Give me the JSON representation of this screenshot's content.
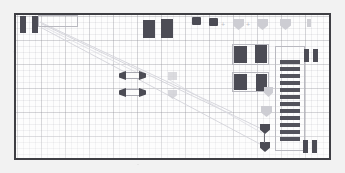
{
  "app": {
    "title": "PCB Layout Canvas",
    "view": "board-editor"
  },
  "canvas": {
    "name": "board-outline",
    "background_color": "#fdfdfd",
    "page_background_color": "#f2f2f2",
    "border_color": "#3f3f44",
    "grid": {
      "visible": true,
      "minor_pitch_px": 6,
      "major_pitch_px": 24,
      "color": "#9a9aa2"
    }
  },
  "palette": {
    "pad_dark": "#4c4c55",
    "pad_light": "#cdcdd3",
    "outline": "#b9b9c0",
    "ratline": "#cfcfd6"
  },
  "legend": {
    "pad_label": "pad",
    "shield_label": "shield-footprint",
    "ladder_label": "resistor-array",
    "ratline_label": "ratline"
  },
  "components": {
    "top_left_pads": [
      {
        "id": "U1-A",
        "x": 18,
        "y": 14,
        "w": 6,
        "h": 17
      },
      {
        "id": "U1-B",
        "x": 30,
        "y": 14,
        "w": 6,
        "h": 17
      }
    ],
    "top_center_pads": [
      {
        "id": "U2-A",
        "x": 141,
        "y": 18,
        "w": 12,
        "h": 18
      },
      {
        "id": "U2-B",
        "x": 159,
        "y": 17,
        "w": 12,
        "h": 19
      }
    ],
    "top_small_pads": [
      {
        "id": "D1",
        "x": 190,
        "y": 15,
        "w": 9,
        "h": 8
      },
      {
        "id": "D2",
        "x": 207,
        "y": 16,
        "w": 9,
        "h": 8
      }
    ],
    "shields_top": [
      {
        "id": "S1",
        "x": 231,
        "y": 17,
        "w": 11,
        "h": 11
      },
      {
        "id": "S2",
        "x": 255,
        "y": 17,
        "w": 11,
        "h": 11
      },
      {
        "id": "S3",
        "x": 278,
        "y": 17,
        "w": 11,
        "h": 11
      }
    ],
    "shields_mid": [
      {
        "id": "S4",
        "x": 262,
        "y": 85,
        "w": 9,
        "h": 10
      },
      {
        "id": "S5",
        "x": 259,
        "y": 104,
        "w": 11,
        "h": 11
      }
    ],
    "shields_dark": [
      {
        "id": "S6",
        "x": 258,
        "y": 122,
        "w": 10,
        "h": 10
      },
      {
        "id": "S7",
        "x": 258,
        "y": 140,
        "w": 10,
        "h": 10
      }
    ],
    "right_pads": [
      {
        "id": "R1",
        "x": 232,
        "y": 44,
        "w": 13,
        "h": 17
      },
      {
        "id": "R2",
        "x": 253,
        "y": 43,
        "w": 12,
        "h": 18
      },
      {
        "id": "R3",
        "x": 232,
        "y": 72,
        "w": 13,
        "h": 16
      },
      {
        "id": "R4",
        "x": 254,
        "y": 72,
        "w": 11,
        "h": 17
      }
    ],
    "edge_pads": [
      {
        "id": "J1-A",
        "x": 302,
        "y": 47,
        "w": 5,
        "h": 13
      },
      {
        "id": "J1-B",
        "x": 311,
        "y": 47,
        "w": 5,
        "h": 13
      },
      {
        "id": "J2-A",
        "x": 301,
        "y": 138,
        "w": 5,
        "h": 13
      },
      {
        "id": "J2-B",
        "x": 310,
        "y": 138,
        "w": 5,
        "h": 13
      },
      {
        "id": "TP1",
        "x": 305,
        "y": 17,
        "w": 4,
        "h": 8
      }
    ],
    "pair_parts": [
      {
        "id": "C1",
        "x": 117,
        "y": 69,
        "w": 27,
        "h": 9
      },
      {
        "id": "C2",
        "x": 117,
        "y": 86,
        "w": 27,
        "h": 9
      }
    ],
    "faint_parts": [
      {
        "id": "F1",
        "x": 166,
        "y": 70,
        "w": 9,
        "h": 8
      },
      {
        "id": "F2",
        "x": 166,
        "y": 88,
        "w": 9,
        "h": 8
      }
    ],
    "ladder": {
      "id": "RN1",
      "x": 278,
      "y": 58,
      "bar_w": 20,
      "bar_h": 4,
      "gap": 3,
      "count": 12
    },
    "outlines": [
      {
        "id": "OL1",
        "x": 230,
        "y": 42,
        "w": 37,
        "h": 21
      },
      {
        "id": "OL2",
        "x": 273,
        "y": 44,
        "w": 30,
        "h": 105
      },
      {
        "id": "OL3",
        "x": 36,
        "y": 13,
        "w": 40,
        "h": 12
      }
    ],
    "ratlines": [
      {
        "from": [
          40,
          22
        ],
        "to": [
          262,
          128
        ]
      },
      {
        "from": [
          40,
          26
        ],
        "to": [
          258,
          142
        ]
      },
      {
        "from": [
          38,
          20
        ],
        "to": [
          230,
          110
        ]
      }
    ],
    "markers": [
      {
        "id": "M1",
        "x": 221,
        "y": 22,
        "glyph": "+"
      },
      {
        "id": "M2",
        "x": 246,
        "y": 22,
        "glyph": "+"
      }
    ]
  }
}
